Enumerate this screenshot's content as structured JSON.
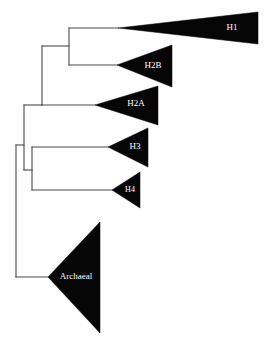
{
  "figure": {
    "width": 270,
    "height": 353,
    "background_color": "#ffffff",
    "branch_color": "#4a4a4a",
    "wedge_color": "#060606",
    "label_color": "#ffffff"
  },
  "chart_data": {
    "type": "diagram",
    "diagram_type": "phylogenetic-cladogram",
    "title": "",
    "orientation": "left-to-right",
    "tips": [
      {
        "id": "H1",
        "label": "H1",
        "wedge": {
          "apex_x": 118,
          "apex_y": 28,
          "right_x": 258,
          "top_y": 12,
          "bottom_y": 44
        },
        "label_x": 232,
        "label_y": 28,
        "label_size": 9
      },
      {
        "id": "H2B",
        "label": "H2B",
        "wedge": {
          "apex_x": 117,
          "apex_y": 65,
          "right_x": 172,
          "top_y": 45,
          "bottom_y": 87
        },
        "label_x": 153,
        "label_y": 66,
        "label_size": 9
      },
      {
        "id": "H2A",
        "label": "H2A",
        "wedge": {
          "apex_x": 95,
          "apex_y": 105,
          "right_x": 158,
          "top_y": 86,
          "bottom_y": 125
        },
        "label_x": 136,
        "label_y": 104,
        "label_size": 9
      },
      {
        "id": "H3",
        "label": "H3",
        "wedge": {
          "apex_x": 108,
          "apex_y": 147,
          "right_x": 148,
          "top_y": 128,
          "bottom_y": 167
        },
        "label_x": 135,
        "label_y": 147,
        "label_size": 9
      },
      {
        "id": "H4",
        "label": "H4",
        "wedge": {
          "apex_x": 112,
          "apex_y": 190,
          "right_x": 140,
          "top_y": 172,
          "bottom_y": 208
        },
        "label_x": 130,
        "label_y": 190,
        "label_size": 8
      },
      {
        "id": "Archaeal",
        "label": "Archaeal",
        "wedge": {
          "apex_x": 48,
          "apex_y": 277,
          "right_x": 100,
          "top_y": 222,
          "bottom_y": 333
        },
        "label_x": 76,
        "label_y": 277,
        "label_size": 9
      }
    ],
    "internal_nodes": [
      {
        "id": "root",
        "x": 16,
        "child_y_top": 145,
        "child_y_bottom": 277
      },
      {
        "id": "eukaryotic",
        "x": 24,
        "child_y_top": 105,
        "child_y_bottom": 170
      },
      {
        "id": "H3-H4-clade",
        "x": 32,
        "child_y_top": 147,
        "child_y_bottom": 190
      },
      {
        "id": "H1-H2B-H2A-clade",
        "x": 42,
        "child_y_top": 46,
        "child_y_bottom": 105
      },
      {
        "id": "H1-H2B-clade",
        "x": 69,
        "child_y_top": 28,
        "child_y_bottom": 65
      }
    ],
    "branches": [
      {
        "from": "root",
        "to": "eukaryotic",
        "x1": 16,
        "x2": 24,
        "y": 145
      },
      {
        "from": "root",
        "to": "Archaeal",
        "x1": 16,
        "x2": 48,
        "y": 277
      },
      {
        "from": "eukaryotic",
        "to": "H1-H2B-H2A-clade",
        "x1": 24,
        "x2": 42,
        "y": 105
      },
      {
        "from": "eukaryotic",
        "to": "H3-H4-clade",
        "x1": 24,
        "x2": 32,
        "y": 170
      },
      {
        "from": "H3-H4-clade",
        "to": "H3",
        "x1": 32,
        "x2": 108,
        "y": 147
      },
      {
        "from": "H3-H4-clade",
        "to": "H4",
        "x1": 32,
        "x2": 112,
        "y": 190
      },
      {
        "from": "H1-H2B-H2A-clade",
        "to": "H1-H2B-clade",
        "x1": 42,
        "x2": 69,
        "y": 46
      },
      {
        "from": "H1-H2B-H2A-clade",
        "to": "H2A",
        "x1": 42,
        "x2": 95,
        "y": 105
      },
      {
        "from": "H1-H2B-clade",
        "to": "H1",
        "x1": 69,
        "x2": 118,
        "y": 28
      },
      {
        "from": "H1-H2B-clade",
        "to": "H2B",
        "x1": 69,
        "x2": 117,
        "y": 65
      }
    ]
  }
}
